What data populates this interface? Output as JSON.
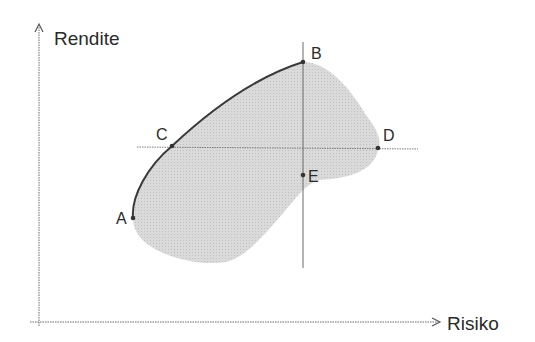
{
  "diagram": {
    "type": "risk-return-efficient-frontier",
    "axes": {
      "y_label": "Rendite",
      "x_label": "Risiko"
    },
    "points": [
      {
        "id": "A",
        "label": "A",
        "x": 133,
        "y": 218
      },
      {
        "id": "B",
        "label": "B",
        "x": 303,
        "y": 62
      },
      {
        "id": "C",
        "label": "C",
        "x": 172,
        "y": 146
      },
      {
        "id": "D",
        "label": "D",
        "x": 378,
        "y": 148
      },
      {
        "id": "E",
        "label": "E",
        "x": 303,
        "y": 175
      }
    ],
    "colors": {
      "region_fill": "#d4d4d4",
      "frontier_curve": "#3a3a3a",
      "axis": "#6a6a6a",
      "guide_line": "#7a7a7a",
      "text": "#2a2a2a"
    }
  }
}
